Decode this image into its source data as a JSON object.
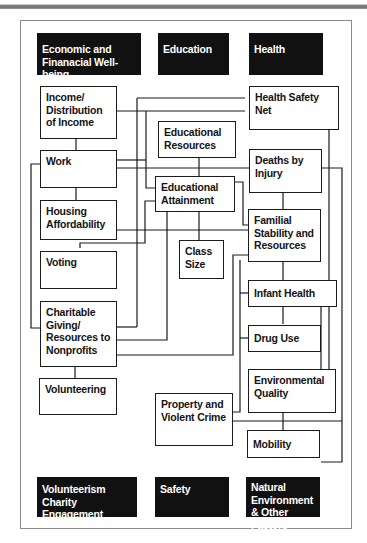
{
  "categories": {
    "economic": "Economic and Finanacial Well-being",
    "education": "Education",
    "health": "Health",
    "volunteerism": "Volunteerism Charity Engagement",
    "safety": "Safety",
    "natural": "Natural Environment & Other Factors"
  },
  "nodes": {
    "income": "Income/ Distribution of Income",
    "work": "Work",
    "housing": "Housing Affordability",
    "voting": "Voting",
    "charitable": "Charitable Giving/ Resources to Nonprofits",
    "volunteering": "Volunteering",
    "edu_resources": "Educational Resources",
    "edu_attainment": "Educational Attainment",
    "class_size": "Class Size",
    "health_safety_net": "Health Safety Net",
    "deaths_injury": "Deaths by Injury",
    "familial": "Familial Stability and Resources",
    "infant_health": "Infant Health",
    "drug_use": "Drug Use",
    "environmental": "Environmental Quality",
    "crime": "Property and Violent Crime",
    "mobility": "Mobility"
  },
  "colors": {
    "category_bg": "#111111",
    "category_text": "#ffffff",
    "node_border": "#1c1c1c",
    "frame_border": "#8c8c8c"
  }
}
